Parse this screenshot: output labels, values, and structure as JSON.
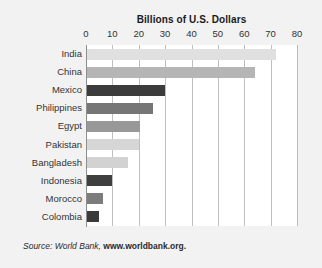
{
  "chart_data": {
    "type": "bar",
    "orientation": "horizontal",
    "title": "Billions of U.S. Dollars",
    "xlabel": "",
    "ylabel": "",
    "xlim": [
      0,
      80
    ],
    "xticks": [
      0,
      10,
      20,
      30,
      40,
      50,
      60,
      70,
      80
    ],
    "grid": true,
    "legend": "none",
    "categories": [
      "India",
      "China",
      "Mexico",
      "Philippines",
      "Egypt",
      "Pakistan",
      "Bangladesh",
      "Indonesia",
      "Morocco",
      "Colombia"
    ],
    "values": [
      72,
      64,
      30,
      25.5,
      20.5,
      20,
      16,
      10,
      6.5,
      5
    ],
    "bar_colors": [
      "#e0e0e0",
      "#b5b5b5",
      "#3c3c3c",
      "#767676",
      "#989898",
      "#d6d6d6",
      "#d2d2d2",
      "#3f3f3f",
      "#7c7c7c",
      "#3a3a3a"
    ],
    "annotations": []
  },
  "source": {
    "lead": "Source: World Bank, ",
    "url": "www.worldbank.org."
  },
  "colors": {
    "page_background": "#f2f2f2",
    "plot_background": "#ffffff",
    "gridline": "#bfbfbf",
    "axis": "#8e8e8e",
    "text": "#333333"
  }
}
